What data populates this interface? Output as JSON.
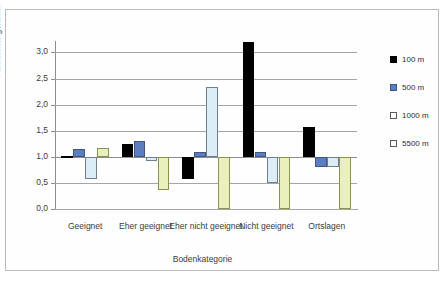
{
  "chart_data": {
    "type": "bar",
    "title": "",
    "xlabel": "Bodenkategorie",
    "ylabel": "Abweichungsfaktor",
    "ylim": [
      0.0,
      3.2
    ],
    "yticks": [
      "0,0",
      "0,5",
      "1,0",
      "1,5",
      "2,0",
      "2,5",
      "3,0"
    ],
    "ytick_values": [
      0.0,
      0.5,
      1.0,
      1.5,
      2.0,
      2.5,
      3.0
    ],
    "baseline": 1.0,
    "grid": true,
    "legend_position": "right",
    "categories": [
      "Geeignet",
      "Eher geeignet",
      "Eher nicht geeignet",
      "Nicht geeignet",
      "Ortslagen"
    ],
    "series": [
      {
        "name": "100 m",
        "color": "#000000",
        "values": [
          1.02,
          1.24,
          0.57,
          3.2,
          1.58
        ]
      },
      {
        "name": "500 m",
        "color": "#5b7ec2",
        "values": [
          1.15,
          1.31,
          1.1,
          1.1,
          0.8
        ]
      },
      {
        "name": "1000 m",
        "color": "#dcedf7",
        "values": [
          0.57,
          0.92,
          2.33,
          0.5,
          0.8
        ]
      },
      {
        "name": "5500 m",
        "color": "#eaf0bc",
        "values": [
          1.17,
          0.37,
          0.0,
          0.0,
          0.0
        ]
      }
    ]
  },
  "legend": {
    "items": [
      {
        "label": "100 m"
      },
      {
        "label": "500 m"
      },
      {
        "label": "1000 m"
      },
      {
        "label": "5500 m"
      }
    ]
  }
}
